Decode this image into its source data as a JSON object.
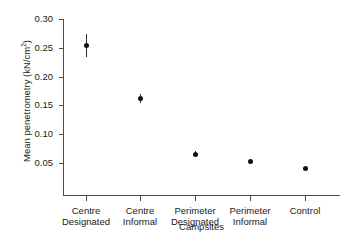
{
  "chart_data": {
    "type": "scatter",
    "title": "",
    "xlabel": "Campsites",
    "ylabel": "Mean penetrometry (kN/cm",
    "ylabel_sup": "2",
    "ylabel_tail": ")",
    "categories": [
      "Centre Designated",
      "Centre Informal",
      "Perimeter Designated",
      "Perimeter Informal",
      "Control"
    ],
    "category_lines": [
      [
        "Centre",
        "Designated"
      ],
      [
        "Centre",
        "Informal"
      ],
      [
        "Perimeter",
        "Designated"
      ],
      [
        "Perimeter",
        "Informal"
      ],
      [
        "Control",
        ""
      ]
    ],
    "values": [
      0.254,
      0.162,
      0.065,
      0.053,
      0.04
    ],
    "errors": [
      0.02,
      0.007,
      0.005,
      0.002,
      0.001
    ],
    "ylim": [
      0.0,
      0.3
    ],
    "yticks": [
      0.05,
      0.1,
      0.15,
      0.2,
      0.25,
      0.3
    ],
    "ytick_labels": [
      "0.05",
      "0.10",
      "0.15",
      "0.20",
      "0.25",
      "0.30"
    ],
    "grid": false,
    "legend": "none",
    "marker_color": "#111111",
    "axis_color": "#4d4d4d",
    "error_bar_color": "#2b2b2b"
  }
}
